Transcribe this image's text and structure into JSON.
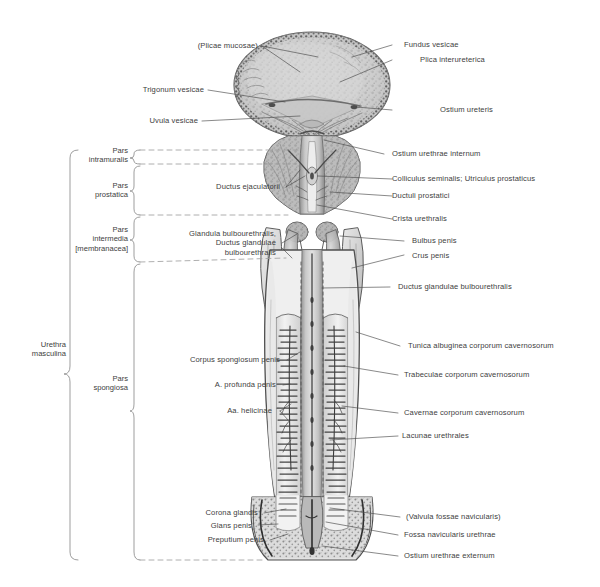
{
  "figure": {
    "background": "#ffffff",
    "ink": "#404040"
  },
  "brackets": {
    "outer": {
      "label": "Urethra\nmasculina"
    },
    "parts": [
      {
        "name": "pars-intramuralis",
        "label": "Pars\nintramuralis"
      },
      {
        "name": "pars-prostatica",
        "label": "Pars\nprostatica"
      },
      {
        "name": "pars-intermedia",
        "label": "Pars\nintermedia\n[membranacea]"
      },
      {
        "name": "pars-spongiosa",
        "label": "Pars\nspongiosa"
      }
    ]
  },
  "labels_left": [
    {
      "name": "plicae-mucosae",
      "text": "(Plicae mucosae)"
    },
    {
      "name": "trigonum-vesicae",
      "text": "Trigonum vesicae"
    },
    {
      "name": "uvula-vesicae",
      "text": "Uvula vesicae"
    },
    {
      "name": "ductus-ejaculatorii",
      "text": "Ductus ejaculatorii"
    },
    {
      "name": "glandula-bulbourethralis",
      "text": "Glandula bulbourethralis,\nDuctus glandulae\nbulbourethralis"
    },
    {
      "name": "corpus-spongiosum-penis",
      "text": "Corpus spongiosum penis"
    },
    {
      "name": "a-profunda-penis",
      "text": "A. profunda penis"
    },
    {
      "name": "aa-helicinae",
      "text": "Aa. helicinae"
    },
    {
      "name": "corona-glandis",
      "text": "Corona glandis"
    },
    {
      "name": "glans-penis",
      "text": "Glans penis"
    },
    {
      "name": "preputium-penis",
      "text": "Preputium penis"
    }
  ],
  "labels_right": [
    {
      "name": "fundus-vesicae",
      "text": "Fundus vesicae"
    },
    {
      "name": "plica-interureterica",
      "text": "Plica interureterica"
    },
    {
      "name": "ostium-ureteris",
      "text": "Ostium ureteris"
    },
    {
      "name": "ostium-urethrae-internum",
      "text": "Ostium urethrae internum"
    },
    {
      "name": "colliculus-seminalis",
      "text": "Colliculus seminalis; Utriculus prostaticus"
    },
    {
      "name": "ductuli-prostatici",
      "text": "Ductuli prostatici"
    },
    {
      "name": "crista-urethralis",
      "text": "Crista urethralis"
    },
    {
      "name": "bulbus-penis",
      "text": "Bulbus penis"
    },
    {
      "name": "crus-penis",
      "text": "Crus penis"
    },
    {
      "name": "ductus-glandulae-bulbourethralis",
      "text": "Ductus glandulae bulbourethralis"
    },
    {
      "name": "tunica-albuginea",
      "text": "Tunica albuginea corporum cavernosorum"
    },
    {
      "name": "trabeculae",
      "text": "Trabeculae corporum cavernosorum"
    },
    {
      "name": "cavernae",
      "text": "Cavernae corporum cavernosorum"
    },
    {
      "name": "lacunae-urethrales",
      "text": "Lacunae urethrales"
    },
    {
      "name": "valvula-fossae-navicularis",
      "text": "(Valvula fossae navicularis)"
    },
    {
      "name": "fossa-navicularis-urethrae",
      "text": "Fossa navicularis urethrae"
    },
    {
      "name": "ostium-urethrae-externum",
      "text": "Ostium urethrae externum"
    }
  ]
}
